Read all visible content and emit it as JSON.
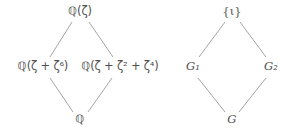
{
  "figure": {
    "background_color": "#ffffff",
    "line_color": "#8d8d8d",
    "text_color": "#4f4f4f"
  },
  "diagrams": [
    {
      "name": "field-extension-lattice",
      "nodes": {
        "top": "ℚ(ζ)",
        "left": "ℚ(ζ + ζ⁶)",
        "right": "ℚ(ζ + ζ² + ζ⁴)",
        "bottom": "ℚ"
      }
    },
    {
      "name": "galois-group-lattice",
      "nodes": {
        "top": "{ι}",
        "left": "G₁",
        "right": "G₂",
        "bottom": "G"
      }
    }
  ],
  "labels": {
    "q_zeta_field": "Q(zeta)",
    "q_zeta_zeta6_field": "Q(zeta + zeta^6)",
    "q_zeta_zeta2_zeta4_field": "Q(zeta + zeta^2 + zeta^4)",
    "q_field": "Q",
    "identity_subgroup": "{iota}",
    "subgroup_g1": "G_1",
    "subgroup_g2": "G_2",
    "group_g": "G"
  }
}
